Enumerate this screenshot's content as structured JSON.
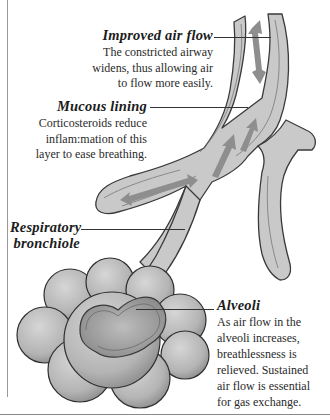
{
  "figure": {
    "colors": {
      "airway_fill": "#c9c9c9",
      "airway_wall": "#a8a8a8",
      "airway_outline": "#3a3a3a",
      "arrow": "#8e8e8e",
      "alveoli_fill": "#bdbdbd",
      "alveoli_shadow": "#8f8f8f",
      "text": "#1c1c1c",
      "frame": "#9a9a9a"
    }
  },
  "callouts": [
    {
      "title": "Improved air flow",
      "lines": [
        "The constricted airway",
        "widens, thus allowing air",
        "to flow more easily."
      ]
    },
    {
      "title": "Mucous lining",
      "lines": [
        "Corticosteroids reduce",
        "inflam:mation of this",
        "layer to ease breathing."
      ]
    },
    {
      "title_lines": [
        "Respiratory",
        "bronchiole"
      ]
    },
    {
      "title": "Alveoli",
      "lines": [
        "As air flow in the",
        "alveoli increases,",
        "breathlessness is",
        "relieved. Sustained",
        "air flow is essential",
        "for gas exchange."
      ]
    }
  ]
}
